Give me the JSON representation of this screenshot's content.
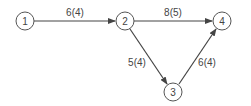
{
  "diagram": {
    "type": "directed-network",
    "nodes": [
      {
        "id": "1",
        "label": "1",
        "x": 25,
        "y": 21
      },
      {
        "id": "2",
        "label": "2",
        "x": 125,
        "y": 21
      },
      {
        "id": "3",
        "label": "3",
        "x": 173,
        "y": 92
      },
      {
        "id": "4",
        "label": "4",
        "x": 222,
        "y": 21
      }
    ],
    "edges": [
      {
        "from": "1",
        "to": "2",
        "label": "6(4)"
      },
      {
        "from": "2",
        "to": "4",
        "label": "8(5)"
      },
      {
        "from": "2",
        "to": "3",
        "label": "5(4)"
      },
      {
        "from": "3",
        "to": "4",
        "label": "6(4)"
      }
    ],
    "colors": {
      "stroke": "#555555",
      "text": "#444444",
      "background": "#ffffff"
    }
  }
}
